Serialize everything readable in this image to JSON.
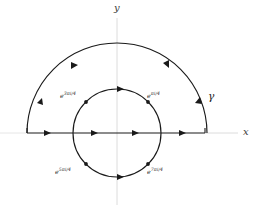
{
  "figure": {
    "background_color": "#ffffff",
    "stroke_color": "#1a1a1a",
    "axis_color": "#d8d8d8"
  },
  "axes": {
    "x_label": "x",
    "y_label": "y",
    "origin": {
      "x": 117,
      "y": 133
    }
  },
  "curves": {
    "outer_arc": {
      "name": "gamma",
      "label": "γ",
      "radius": 90,
      "description": "upper semicircular arc traversed counterclockwise"
    },
    "inner_circle": {
      "radius": 44,
      "description": "full circle of radius 1 traversed counterclockwise"
    },
    "real_axis_segment": {
      "from_x": 27,
      "to_x": 205,
      "description": "horizontal segment along the real axis with rightward arrows"
    }
  },
  "points": [
    {
      "label_base": "e",
      "exponent": "3πi/4",
      "full": "e^{3πi/4}",
      "angle_deg": 135,
      "position": {
        "x": 63,
        "y": 92
      }
    },
    {
      "label_base": "e",
      "exponent": "πi/4",
      "full": "e^{πi/4}",
      "angle_deg": 45,
      "position": {
        "x": 148,
        "y": 92
      }
    },
    {
      "label_base": "e",
      "exponent": "5πi/4",
      "full": "e^{5πi/4}",
      "angle_deg": 225,
      "position": {
        "x": 57,
        "y": 168
      }
    },
    {
      "label_base": "e",
      "exponent": "7πi/4",
      "full": "e^{7πi/4}",
      "angle_deg": 315,
      "position": {
        "x": 148,
        "y": 168
      }
    }
  ],
  "annotations": {
    "gamma": "γ"
  }
}
